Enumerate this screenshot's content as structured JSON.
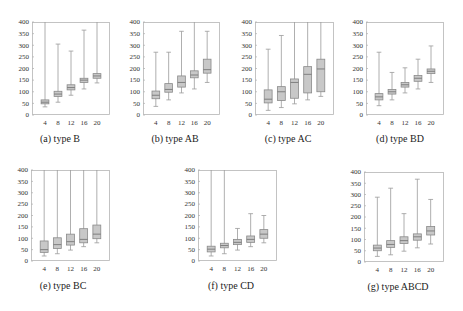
{
  "colors": {
    "box_fill": "#c8c8c8",
    "box_stroke": "#8a8a8a",
    "whisker": "#9a9a9a",
    "median": "#777777",
    "frame": "#b5b5b5",
    "text": "#333333"
  },
  "chart_data": [
    {
      "type": "box",
      "title": "(a) type B",
      "xlabel": "",
      "ylabel": "",
      "categories": [
        "4",
        "8",
        "12",
        "16",
        "20"
      ],
      "ylim": [
        0,
        400
      ],
      "yticks": [
        0,
        50,
        100,
        150,
        200,
        250,
        300,
        350,
        400
      ],
      "grid": false,
      "boxes": [
        {
          "min": 35,
          "q1": 48,
          "median": 55,
          "q3": 65,
          "max": 400
        },
        {
          "min": 55,
          "q1": 80,
          "median": 90,
          "q3": 102,
          "max": 305
        },
        {
          "min": 85,
          "q1": 108,
          "median": 118,
          "q3": 130,
          "max": 275
        },
        {
          "min": 112,
          "q1": 140,
          "median": 150,
          "q3": 158,
          "max": 365
        },
        {
          "min": 138,
          "q1": 158,
          "median": 168,
          "q3": 178,
          "max": 400
        }
      ]
    },
    {
      "type": "box",
      "title": "(b) type AB",
      "xlabel": "",
      "ylabel": "",
      "categories": [
        "4",
        "8",
        "12",
        "16",
        "20"
      ],
      "ylim": [
        0,
        400
      ],
      "yticks": [
        0,
        50,
        100,
        150,
        200,
        250,
        300,
        350,
        400
      ],
      "grid": false,
      "boxes": [
        {
          "min": 37,
          "q1": 70,
          "median": 85,
          "q3": 103,
          "max": 270
        },
        {
          "min": 65,
          "q1": 98,
          "median": 110,
          "q3": 135,
          "max": 270
        },
        {
          "min": 95,
          "q1": 120,
          "median": 140,
          "q3": 168,
          "max": 360
        },
        {
          "min": 112,
          "q1": 160,
          "median": 172,
          "q3": 190,
          "max": 400
        },
        {
          "min": 140,
          "q1": 180,
          "median": 195,
          "q3": 240,
          "max": 360
        }
      ]
    },
    {
      "type": "box",
      "title": "(c) type AC",
      "xlabel": "",
      "ylabel": "",
      "categories": [
        "4",
        "8",
        "12",
        "16",
        "20"
      ],
      "ylim": [
        0,
        400
      ],
      "yticks": [
        0,
        50,
        100,
        150,
        200,
        250,
        300,
        350,
        400
      ],
      "grid": false,
      "boxes": [
        {
          "min": 20,
          "q1": 52,
          "median": 68,
          "q3": 108,
          "max": 283
        },
        {
          "min": 32,
          "q1": 62,
          "median": 100,
          "q3": 122,
          "max": 342
        },
        {
          "min": 48,
          "q1": 72,
          "median": 140,
          "q3": 155,
          "max": 400
        },
        {
          "min": 65,
          "q1": 95,
          "median": 175,
          "q3": 208,
          "max": 400
        },
        {
          "min": 80,
          "q1": 100,
          "median": 198,
          "q3": 240,
          "max": 400
        }
      ]
    },
    {
      "type": "box",
      "title": "(d) type BD",
      "xlabel": "",
      "ylabel": "",
      "categories": [
        "4",
        "8",
        "12",
        "16",
        "20"
      ],
      "ylim": [
        0,
        400
      ],
      "yticks": [
        0,
        50,
        100,
        150,
        200,
        250,
        300,
        350,
        400
      ],
      "grid": false,
      "boxes": [
        {
          "min": 40,
          "q1": 65,
          "median": 78,
          "q3": 92,
          "max": 270
        },
        {
          "min": 65,
          "q1": 90,
          "median": 100,
          "q3": 110,
          "max": 183
        },
        {
          "min": 95,
          "q1": 120,
          "median": 130,
          "q3": 140,
          "max": 203
        },
        {
          "min": 112,
          "q1": 145,
          "median": 158,
          "q3": 170,
          "max": 240
        },
        {
          "min": 140,
          "q1": 178,
          "median": 188,
          "q3": 198,
          "max": 297
        }
      ]
    },
    {
      "type": "box",
      "title": "(e) type BC",
      "xlabel": "",
      "ylabel": "",
      "categories": [
        "4",
        "8",
        "12",
        "16",
        "20"
      ],
      "ylim": [
        0,
        400
      ],
      "yticks": [
        0,
        50,
        100,
        150,
        200,
        250,
        300,
        350,
        400
      ],
      "grid": false,
      "boxes": [
        {
          "min": 22,
          "q1": 38,
          "median": 50,
          "q3": 88,
          "max": 400
        },
        {
          "min": 32,
          "q1": 55,
          "median": 72,
          "q3": 102,
          "max": 400
        },
        {
          "min": 48,
          "q1": 70,
          "median": 85,
          "q3": 118,
          "max": 400
        },
        {
          "min": 63,
          "q1": 80,
          "median": 95,
          "q3": 142,
          "max": 400
        },
        {
          "min": 80,
          "q1": 98,
          "median": 118,
          "q3": 158,
          "max": 400
        }
      ]
    },
    {
      "type": "box",
      "title": "(f) type CD",
      "xlabel": "",
      "ylabel": "",
      "categories": [
        "4",
        "8",
        "12",
        "16",
        "20"
      ],
      "ylim": [
        0,
        400
      ],
      "yticks": [
        0,
        50,
        100,
        150,
        200,
        250,
        300,
        350,
        400
      ],
      "grid": false,
      "boxes": [
        {
          "min": 22,
          "q1": 40,
          "median": 52,
          "q3": 65,
          "max": 400
        },
        {
          "min": 32,
          "q1": 58,
          "median": 68,
          "q3": 78,
          "max": 400
        },
        {
          "min": 48,
          "q1": 72,
          "median": 82,
          "q3": 95,
          "max": 143
        },
        {
          "min": 63,
          "q1": 82,
          "median": 95,
          "q3": 110,
          "max": 208
        },
        {
          "min": 80,
          "q1": 100,
          "median": 118,
          "q3": 138,
          "max": 200
        }
      ]
    },
    {
      "type": "box",
      "title": "(g) type ABCD",
      "xlabel": "",
      "ylabel": "",
      "categories": [
        "4",
        "8",
        "12",
        "16",
        "20"
      ],
      "ylim": [
        0,
        400
      ],
      "yticks": [
        0,
        50,
        100,
        150,
        200,
        250,
        300,
        350,
        400
      ],
      "grid": false,
      "boxes": [
        {
          "min": 25,
          "q1": 50,
          "median": 62,
          "q3": 75,
          "max": 288
        },
        {
          "min": 32,
          "q1": 65,
          "median": 78,
          "q3": 95,
          "max": 328
        },
        {
          "min": 48,
          "q1": 82,
          "median": 95,
          "q3": 112,
          "max": 215
        },
        {
          "min": 63,
          "q1": 97,
          "median": 112,
          "q3": 125,
          "max": 368
        },
        {
          "min": 80,
          "q1": 120,
          "median": 138,
          "q3": 158,
          "max": 278
        }
      ]
    }
  ],
  "layout": [
    {
      "left": 32,
      "top": 22,
      "width": 78,
      "height": 93,
      "caption_x": 60,
      "caption_y": 140
    },
    {
      "left": 143,
      "top": 22,
      "width": 77,
      "height": 93,
      "caption_x": 175,
      "caption_y": 140
    },
    {
      "left": 255,
      "top": 22,
      "width": 79,
      "height": 93,
      "caption_x": 288,
      "caption_y": 140
    },
    {
      "left": 366,
      "top": 22,
      "width": 78,
      "height": 93,
      "caption_x": 400,
      "caption_y": 140
    },
    {
      "left": 31,
      "top": 170,
      "width": 79,
      "height": 91,
      "caption_x": 63,
      "caption_y": 287
    },
    {
      "left": 198,
      "top": 170,
      "width": 79,
      "height": 91,
      "caption_x": 231,
      "caption_y": 287
    },
    {
      "left": 364,
      "top": 172,
      "width": 80,
      "height": 90,
      "caption_x": 398,
      "caption_y": 288
    }
  ]
}
